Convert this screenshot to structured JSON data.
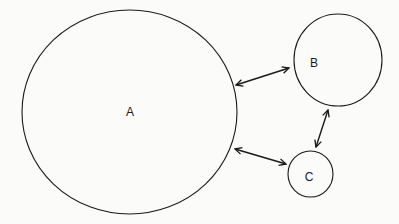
{
  "diagram": {
    "nodes": [
      {
        "id": "A",
        "label": "A",
        "cx": 129.5,
        "cy": 112,
        "rx": 107.5,
        "ry": 102,
        "label_x": 130,
        "label_y": 112
      },
      {
        "id": "B",
        "label": "B",
        "cx": 338,
        "cy": 60,
        "rx": 44,
        "ry": 46,
        "label_x": 314,
        "label_y": 63
      },
      {
        "id": "C",
        "label": "C",
        "cx": 310.5,
        "cy": 174,
        "rx": 22.5,
        "ry": 23,
        "label_x": 309,
        "label_y": 177
      }
    ],
    "edges": [
      {
        "from": "A",
        "to": "B",
        "type": "bidirectional",
        "x1": 236,
        "y1": 85,
        "x2": 289,
        "y2": 68
      },
      {
        "from": "A",
        "to": "C",
        "type": "bidirectional",
        "x1": 235,
        "y1": 149,
        "x2": 286,
        "y2": 164
      },
      {
        "from": "B",
        "to": "C",
        "type": "bidirectional",
        "x1": 328,
        "y1": 110,
        "x2": 316,
        "y2": 147
      }
    ]
  }
}
